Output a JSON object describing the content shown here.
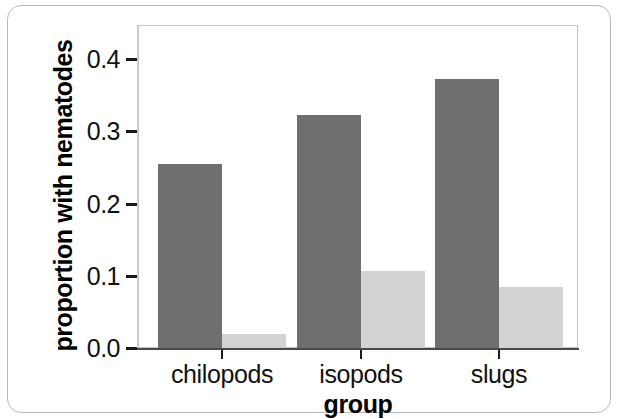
{
  "chart_data": {
    "type": "bar",
    "title": "",
    "xlabel": "group",
    "ylabel": "proportion with nematodes",
    "categories": [
      "chilopods",
      "isopods",
      "slugs"
    ],
    "series": [
      {
        "name": "dark",
        "color": "#6f6f6f",
        "values": [
          0.255,
          0.322,
          0.372
        ]
      },
      {
        "name": "light",
        "color": "#d2d2d2",
        "values": [
          0.02,
          0.107,
          0.085
        ]
      }
    ],
    "ylim": [
      0.0,
      0.45
    ],
    "yticks": [
      0.0,
      0.1,
      0.2,
      0.3,
      0.4
    ],
    "ytick_labels": [
      "0.0",
      "0.1",
      "0.2",
      "0.3",
      "0.4"
    ],
    "grid": false,
    "legend": "none"
  }
}
